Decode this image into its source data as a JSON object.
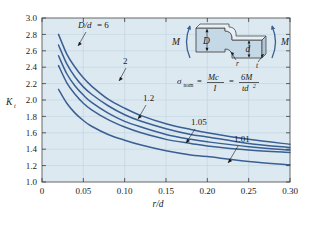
{
  "figure": {
    "title": "",
    "background": "#ffffff",
    "plot_background": "#dde9f1",
    "curve_color": "#3a5f93"
  },
  "axis": {
    "y_label": "K",
    "y_label_sub": "t",
    "x_label": "r/d",
    "y_ticks": [
      "1.0",
      "1.2",
      "1.4",
      "1.6",
      "1.8",
      "2.0",
      "2.2",
      "2.4",
      "2.6",
      "2.8",
      "3.0"
    ],
    "x_ticks": [
      "0",
      "0.05",
      "0.10",
      "0.15",
      "0.20",
      "0.25",
      "0.30"
    ]
  },
  "curve_labels": {
    "c1_prefix": "D/d",
    "c1_eq": " = 6",
    "c2": "2",
    "c3": "1.2",
    "c4": "1.05",
    "c5": "1.01"
  },
  "inset": {
    "moment_left": "M",
    "moment_right": "M",
    "dim_big": "D",
    "dim_small": "d",
    "radius": "r",
    "thickness": "t"
  },
  "formula": {
    "sigma": "σ",
    "sigma_sub": "nom",
    "eq1": "=",
    "num1": "Mc",
    "den1": "I",
    "eq2": "=",
    "num2": "6M",
    "den2": "td",
    "den2_sup": "2"
  },
  "chart_data": {
    "type": "line",
    "xlabel": "r/d",
    "ylabel": "K_t",
    "xlim": [
      0,
      0.3
    ],
    "ylim": [
      1.0,
      3.0
    ],
    "xticks": [
      0,
      0.05,
      0.1,
      0.15,
      0.2,
      0.25,
      0.3
    ],
    "yticks": [
      1.0,
      1.2,
      1.4,
      1.6,
      1.8,
      2.0,
      2.2,
      2.4,
      2.6,
      2.8,
      3.0
    ],
    "grid": true,
    "legend": "inline-curve-labels",
    "x": [
      0.02,
      0.03,
      0.04,
      0.05,
      0.06,
      0.08,
      0.1,
      0.12,
      0.15,
      0.18,
      0.2,
      0.25,
      0.3
    ],
    "series": [
      {
        "name": "D/d = 6",
        "label": "D/d = 6",
        "values": [
          2.8,
          2.56,
          2.4,
          2.27,
          2.17,
          2.01,
          1.9,
          1.81,
          1.71,
          1.64,
          1.6,
          1.52,
          1.46
        ]
      },
      {
        "name": "D/d = 2",
        "label": "2",
        "values": [
          2.67,
          2.44,
          2.28,
          2.16,
          2.07,
          1.93,
          1.82,
          1.74,
          1.65,
          1.58,
          1.55,
          1.47,
          1.42
        ]
      },
      {
        "name": "D/d = 1.2",
        "label": "1.2",
        "values": [
          2.54,
          2.32,
          2.17,
          2.06,
          1.97,
          1.84,
          1.74,
          1.67,
          1.58,
          1.52,
          1.49,
          1.43,
          1.39
        ]
      },
      {
        "name": "D/d = 1.05",
        "label": "1.05",
        "values": [
          2.42,
          2.21,
          2.07,
          1.96,
          1.88,
          1.76,
          1.67,
          1.6,
          1.52,
          1.47,
          1.44,
          1.39,
          1.36
        ]
      },
      {
        "name": "D/d = 1.01",
        "label": "1.01",
        "values": [
          2.13,
          1.96,
          1.84,
          1.75,
          1.68,
          1.58,
          1.51,
          1.45,
          1.38,
          1.33,
          1.31,
          1.25,
          1.21
        ]
      }
    ]
  }
}
